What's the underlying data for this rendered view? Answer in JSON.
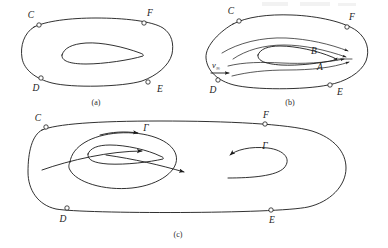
{
  "figure": {
    "title_visible": false,
    "background_color": "#ffffff",
    "line_color": "#1a1a1a",
    "panels": [
      {
        "id": "a",
        "caption": "(a)",
        "contour_labels": [
          "C",
          "F",
          "D",
          "E"
        ],
        "description_visible_elements": "closed material contour with four marked points and an airfoil section inside"
      },
      {
        "id": "b",
        "caption": "(b)",
        "contour_labels": [
          "C",
          "F",
          "D",
          "E"
        ],
        "flow_labels": [
          "B",
          "A"
        ],
        "velocity_label": "v",
        "velocity_subscript": "∞",
        "description_visible_elements": "same contour with streamlines past the airfoil, upper path B and lower path A near trailing edge"
      },
      {
        "id": "c",
        "caption": "(c)",
        "contour_labels": [
          "C",
          "F",
          "D",
          "E"
        ],
        "circulation_labels": [
          "Γ",
          "Γ"
        ],
        "description_visible_elements": "contour enclosing bound circulation loop around airfoil and a starting vortex loop at right"
      }
    ],
    "point_labels": {
      "C": "C",
      "D": "D",
      "E": "E",
      "F": "F",
      "A": "A",
      "B": "B"
    },
    "symbols": {
      "gamma": "Γ",
      "infinity": "∞",
      "v": "v"
    },
    "captions": {
      "a": "(a)",
      "b": "(b)",
      "c": "(c)"
    }
  }
}
